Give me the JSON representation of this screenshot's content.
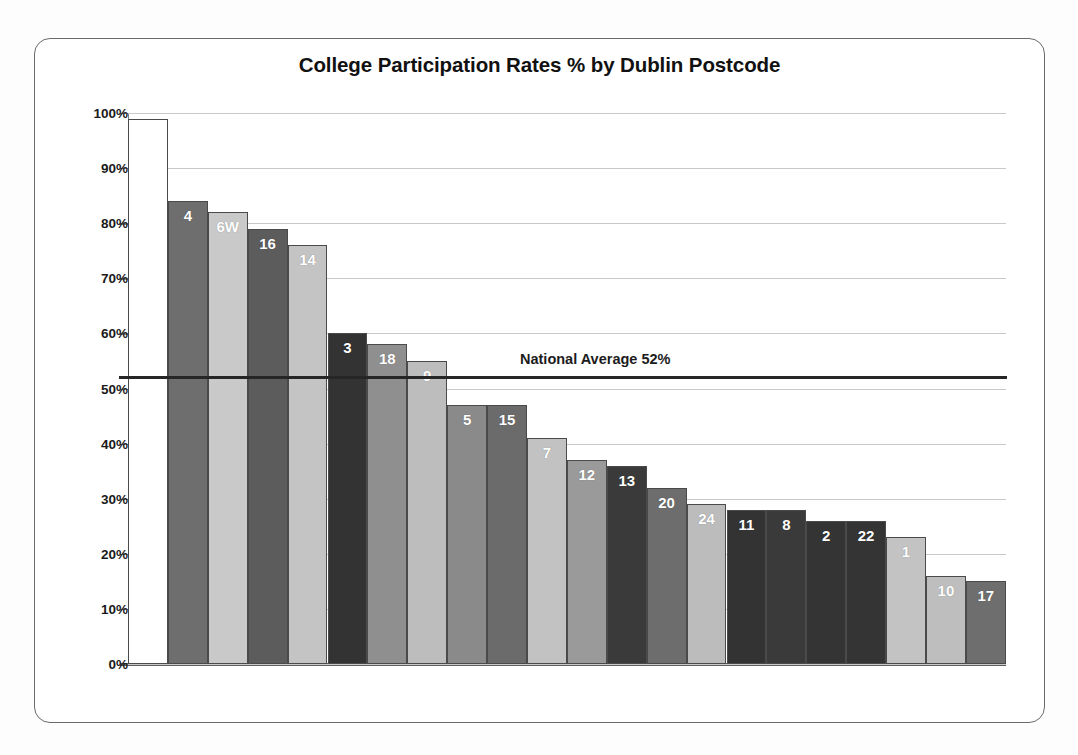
{
  "frame": {
    "title": "College Participation Rates %  by Dublin Postcode"
  },
  "chart_data": {
    "type": "bar",
    "title": "College Participation Rates %  by Dublin Postcode",
    "xlabel": "",
    "ylabel": "",
    "ylim": [
      0,
      100
    ],
    "grid": true,
    "legend": false,
    "y_tick_labels": [
      "100%",
      "90%",
      "80%",
      "70%",
      "60%",
      "50%",
      "40%",
      "30%",
      "20%",
      "10%",
      "0%"
    ],
    "y_ticks": [
      100,
      90,
      80,
      70,
      60,
      50,
      40,
      30,
      20,
      10,
      0
    ],
    "value_unit": "%",
    "categories": [
      "",
      "4",
      "6W",
      "16",
      "14",
      "3",
      "18",
      "9",
      "5",
      "15",
      "7",
      "12",
      "13",
      "20",
      "24",
      "11",
      "8",
      "2",
      "22",
      "1",
      "10",
      "17"
    ],
    "values": [
      99,
      84,
      82,
      79,
      76,
      60,
      58,
      55,
      47,
      47,
      41,
      37,
      36,
      32,
      29,
      28,
      28,
      26,
      26,
      23,
      16,
      15
    ],
    "bar_colors": [
      "#ffffff",
      "#6e6e6e",
      "#c9c9c9",
      "#5c5c5c",
      "#c4c4c4",
      "#333333",
      "#8f8f8f",
      "#bdbdbd",
      "#8a8a8a",
      "#6b6b6b",
      "#c2c2c2",
      "#9a9a9a",
      "#3a3a3a",
      "#6d6d6d",
      "#bcbcbc",
      "#333333",
      "#3a3a3a",
      "#343434",
      "#343434",
      "#c3c3c3",
      "#bebebe",
      "#6e6e6e"
    ],
    "annotations": [
      {
        "name": "national-average",
        "text": "National Average 52%",
        "value": 52,
        "kind": "horizontal-line",
        "color": "#262626"
      }
    ]
  }
}
